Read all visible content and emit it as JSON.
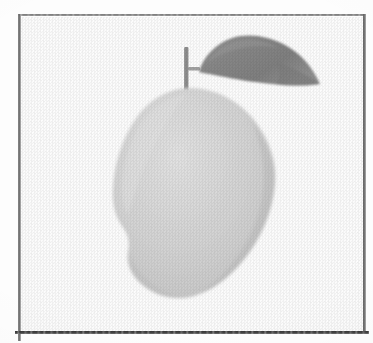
{
  "figure": {
    "caption": "",
    "style": "grayscale scanned line illustration",
    "background_color": "#fdfdfd",
    "canvas": {
      "width": 373,
      "height": 343
    }
  },
  "frame": {
    "name": "rectangular border",
    "left": 18,
    "top": 14,
    "right": 366,
    "bottom": 332,
    "stroke_color": "#6a6a6a",
    "bottom_stroke_color": "#3a3a3a",
    "stroke_width_px": 2,
    "bottom_stroke_width_px": 3
  },
  "illustration": {
    "parts": [
      {
        "id": "fruit-body",
        "label": "mango fruit body",
        "color": "#d4d4d4",
        "shade_color": "#c2c2c2",
        "highlight_color": "#e6e6e6",
        "bounds": {
          "x": 113,
          "y": 88,
          "width": 162,
          "height": 210
        },
        "description": "light gray ovoid with a rounded beak bulge at lower left"
      },
      {
        "id": "leaf",
        "label": "mango leaf",
        "color": "#8a8a8a",
        "shade_color": "#7b7b7b",
        "bounds": {
          "x": 193,
          "y": 35,
          "width": 127,
          "height": 60
        },
        "description": "dark gray lanceolate leaf tapering to a sharp point at the right"
      },
      {
        "id": "stem",
        "label": "mango stem",
        "color": "#8e8e8e",
        "bounds": {
          "x": 184,
          "y": 47,
          "width": 5,
          "height": 43
        },
        "description": "thin vertical stalk with a short horizontal nub joining the leaf"
      }
    ]
  }
}
